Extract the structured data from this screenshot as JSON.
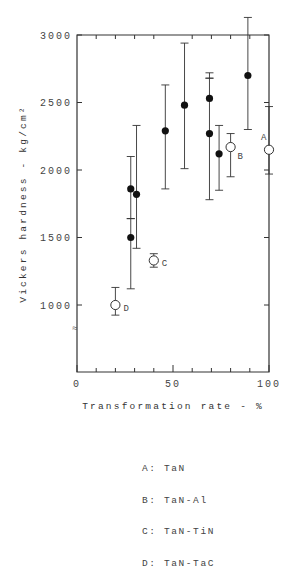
{
  "chart_data": {
    "type": "scatter",
    "title": "",
    "xlabel": "Transformation rate - %",
    "ylabel": "Vickers hardness - kg/cm²",
    "xlim": [
      0,
      100
    ],
    "ylim": [
      0,
      3000
    ],
    "y_axis_break": true,
    "x_ticks": [
      0,
      50,
      100
    ],
    "x_minor_ticks": [
      10,
      20,
      30,
      40,
      60,
      70,
      80,
      90
    ],
    "y_ticks": [
      1000,
      1500,
      2000,
      2500,
      3000
    ],
    "x_tick_labels": [
      "0",
      "50",
      "100"
    ],
    "y_tick_labels": [
      "1000",
      "1500",
      "2000",
      "2500",
      "3000"
    ],
    "grid": false,
    "series": [
      {
        "name": "Filled points",
        "marker": "filled-circle",
        "points": [
          {
            "x": 28,
            "y": 1860,
            "err_high": 2100,
            "err_low": 1640
          },
          {
            "x": 28,
            "y": 1500,
            "err_high": 1640,
            "err_low": 1120
          },
          {
            "x": 31,
            "y": 1820,
            "err_high": 2330,
            "err_low": 1420
          },
          {
            "x": 46,
            "y": 2290,
            "err_high": 2630,
            "err_low": 1860
          },
          {
            "x": 56,
            "y": 2480,
            "err_high": 2940,
            "err_low": 2010
          },
          {
            "x": 69,
            "y": 2530,
            "err_high": 2720,
            "err_low": 2680
          },
          {
            "x": 69,
            "y": 2270,
            "err_high": 2680,
            "err_low": 1780
          },
          {
            "x": 74,
            "y": 2120,
            "err_high": 2330,
            "err_low": 1850
          },
          {
            "x": 89,
            "y": 2700,
            "err_high": 3130,
            "err_low": 2300
          }
        ]
      },
      {
        "name": "Open points (labeled)",
        "marker": "open-circle",
        "points": [
          {
            "label": "A",
            "x": 100,
            "y": 2150,
            "err_high": 2470,
            "err_low": 1970
          },
          {
            "label": "B",
            "x": 80,
            "y": 2170,
            "err_high": 2270,
            "err_low": 1950
          },
          {
            "label": "C",
            "x": 40,
            "y": 1330,
            "err_high": 1380,
            "err_low": 1280
          },
          {
            "label": "D",
            "x": 20,
            "y": 1000,
            "err_high": 1130,
            "err_low": 925
          }
        ]
      }
    ],
    "legend": [
      {
        "key": "A",
        "text": "A: TaN"
      },
      {
        "key": "B",
        "text": "B: TaN-Al"
      },
      {
        "key": "C",
        "text": "C: TaN-TiN"
      },
      {
        "key": "D",
        "text": "D: TaN-TaC"
      }
    ],
    "legend_position": "below"
  },
  "axes": {
    "x_title": "Transformation rate - %",
    "y_title": "Vickers hardness - kg/cm²"
  },
  "legend": {
    "a": "A: TaN",
    "b": "B: TaN-Al",
    "c": "C: TaN-TiN",
    "d": "D: TaN-TaC"
  }
}
